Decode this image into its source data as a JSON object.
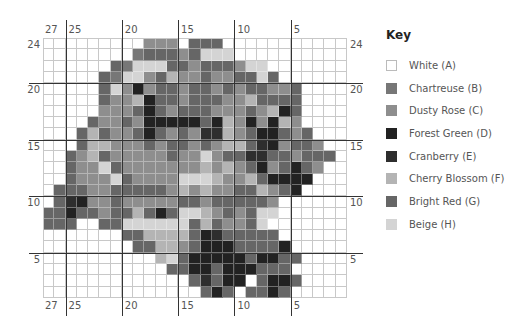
{
  "legend": {
    "title": "Key",
    "items": [
      {
        "code": "A",
        "label": "White (A)",
        "color": "#ffffff"
      },
      {
        "code": "B",
        "label": "Chartreuse (B)",
        "color": "#777777"
      },
      {
        "code": "C",
        "label": "Dusty Rose (C)",
        "color": "#8e8e8e"
      },
      {
        "code": "D",
        "label": "Forest Green (D)",
        "color": "#222222"
      },
      {
        "code": "E",
        "label": "Cranberry (E)",
        "color": "#2e2e2e"
      },
      {
        "code": "F",
        "label": "Cherry Blossom (F)",
        "color": "#b4b4b4"
      },
      {
        "code": "G",
        "label": "Bright Red (G)",
        "color": "#666666"
      },
      {
        "code": "H",
        "label": "Beige (H)",
        "color": "#d4d4d4"
      }
    ]
  },
  "grid": {
    "columns": 27,
    "rows": 23,
    "top_column_labels": [
      {
        "text": "27",
        "col": 0
      },
      {
        "text": "25",
        "col": 2
      },
      {
        "text": "20",
        "col": 7
      },
      {
        "text": "15",
        "col": 12
      },
      {
        "text": "10",
        "col": 17
      },
      {
        "text": "5",
        "col": 22
      }
    ],
    "bottom_column_labels": [
      {
        "text": "27",
        "col": 0
      },
      {
        "text": "25",
        "col": 2
      },
      {
        "text": "20",
        "col": 7
      },
      {
        "text": "15",
        "col": 12
      },
      {
        "text": "10",
        "col": 17
      },
      {
        "text": "5",
        "col": 22
      }
    ],
    "row_labels": [
      {
        "text": "24",
        "row": 0,
        "side": "both"
      },
      {
        "text": "20",
        "row": 4,
        "side": "both"
      },
      {
        "text": "15",
        "row": 9,
        "side": "both"
      },
      {
        "text": "10",
        "row": 14,
        "side": "both"
      },
      {
        "text": "5",
        "row": 19,
        "side": "both"
      }
    ],
    "thick_cols": [
      2,
      7,
      12,
      17,
      22
    ],
    "thick_rows": [
      4,
      9,
      14,
      19
    ],
    "pattern": [
      "AAAAAAAAACCCAGGGAAAAAAAAAAA",
      "AAAAAAAABGGGCGHHHAAAAAAAAAA",
      "AAAAAAGBHHHGGCGGGCHHAAAAAAA",
      "AAAAAGBHHCGFCCGCCGGHGAAAAAA",
      "AAAAAGHCDCGGCGGCGCGGCCGAAAA",
      "AAAAAGCCFDGGCGGGCCFGGGGAAAA",
      "AAAAACCCGDGCGGGCCCGCFDGAAAA",
      "AAAAGCCGCDDDDDGDFCDCDFCAAAA",
      "AAAGFGCCGDGCGCEEFCGDDGCGAAA",
      "AAAGFFCCCGCGGCGCFFGEDCGGCAA",
      "AAGCFGCCCCCGCCHCGGEEGGCGGGA",
      "AAGCCHGCCCCCCCFCFCGDCGDGCAA",
      "AAGCCCHGCCCCHHHFCCFGDDDDAAA",
      "AGGGCCGGGGGCFCFCCGGFCGDAAAA",
      "AGEDCCGCCCCCGGCGGGGGCAAAAAA",
      "GGDGGCGGFGDGHHFCGCGHHAAAAAA",
      "GGGAAGGHHHHHHGFGCCGHAAAAAAA",
      "AAAAAAAGGFFFFGDEGGGGGAAAAAA",
      "AAAAAAAAGGFFCGDDDGGGGDAAAAA",
      "AAAAAAAAAAFHGDDDDDGDDGGAAAA",
      "AAAAAAAAAAAGGDDGDDDGGGAAAAA",
      "AAAAAAAAAAAAAGEGDDAGDDGAAAA",
      "AAAAAAAAAAAAAAGDGAGGDGAAAAA"
    ]
  }
}
